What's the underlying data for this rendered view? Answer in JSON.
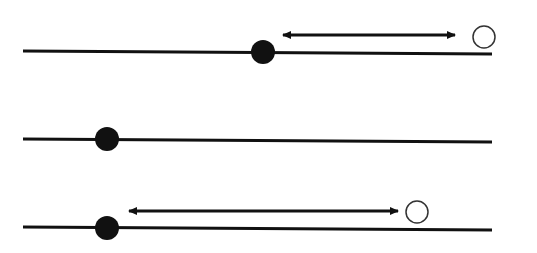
{
  "diagram": {
    "colors": {
      "line": "#111111",
      "filled": "#111111",
      "open_stroke": "#333333",
      "background": "#ffffff"
    },
    "rows": [
      {
        "id": "row-1",
        "line": {
          "x1": 23,
          "x2": 492,
          "y1": 51,
          "y2": 54
        },
        "filled_dot": {
          "cx": 263,
          "cy": 52,
          "r": 12
        },
        "arrow": {
          "x1": 276,
          "x2": 455,
          "y": 35
        },
        "open_circle": {
          "cx": 484,
          "cy": 37,
          "r": 11
        }
      },
      {
        "id": "row-2",
        "line": {
          "x1": 23,
          "x2": 492,
          "y1": 139,
          "y2": 142
        },
        "filled_dot": {
          "cx": 107,
          "cy": 139,
          "r": 12
        }
      },
      {
        "id": "row-3",
        "line": {
          "x1": 23,
          "x2": 492,
          "y1": 227,
          "y2": 230
        },
        "filled_dot": {
          "cx": 107,
          "cy": 228,
          "r": 12
        },
        "arrow": {
          "x1": 122,
          "x2": 398,
          "y": 211
        },
        "open_circle": {
          "cx": 417,
          "cy": 212,
          "r": 11
        }
      }
    ]
  }
}
